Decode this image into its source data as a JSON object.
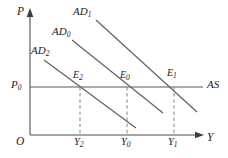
{
  "figure": {
    "kind": "ad-as-diagram",
    "colors": {
      "axis": "#4d4d4d",
      "curve": "#595959",
      "dashed": "#8c8c8c",
      "text": "#1a1a1a",
      "background": "#ffffff"
    },
    "axes": {
      "vertical": {
        "label": "P",
        "label_x": 17,
        "label_y": 7
      },
      "horizontal": {
        "label": "Y",
        "label_x": 207,
        "label_y": 133
      },
      "origin": {
        "label": "O",
        "label_x": 17,
        "label_y": 136
      }
    },
    "curves": [
      {
        "name": "AD1",
        "label": "AD",
        "sub": "1",
        "label_x": 73,
        "label_y": 7,
        "x1": 96,
        "y1": 20,
        "x2": 197,
        "y2": 112
      },
      {
        "name": "AD0",
        "label": "AD",
        "sub": "0",
        "label_x": 52,
        "label_y": 26,
        "x1": 72,
        "y1": 40,
        "x2": 163,
        "y2": 113
      },
      {
        "name": "AD2",
        "label": "AD",
        "sub": "2",
        "label_x": 31,
        "label_y": 45,
        "x1": 44,
        "y1": 60,
        "x2": 136,
        "y2": 128
      },
      {
        "name": "AS",
        "label": "AS",
        "sub": "",
        "label_x": 207,
        "label_y": 79,
        "x1": 30,
        "y1": 87,
        "x2": 203,
        "y2": 87
      }
    ],
    "price_level": {
      "label": "P",
      "sub": "0",
      "label_x": 11,
      "label_y": 79,
      "y": 87
    },
    "equilibria": [
      {
        "name": "E2",
        "label": "E",
        "sub": "2",
        "label_x": 73,
        "label_y": 71,
        "x": 80,
        "y": 87
      },
      {
        "name": "E0",
        "label": "E",
        "sub": "0",
        "label_x": 120,
        "label_y": 71,
        "x": 127,
        "y": 87
      },
      {
        "name": "E1",
        "label": "E",
        "sub": "1",
        "label_x": 167,
        "label_y": 69,
        "x": 174,
        "y": 87
      }
    ],
    "output_ticks": [
      {
        "name": "Y2",
        "label": "Y",
        "sub": "2",
        "label_x": 74,
        "label_y": 137,
        "x": 80
      },
      {
        "name": "Y0",
        "label": "Y",
        "sub": "0",
        "label_x": 121,
        "label_y": 137,
        "x": 127
      },
      {
        "name": "Y1",
        "label": "Y",
        "sub": "1",
        "label_x": 168,
        "label_y": 137,
        "x": 174
      }
    ],
    "dashed_lines": [
      {
        "name": "dashed-Y2",
        "x": 80,
        "y_top": 87,
        "y_bottom": 135
      },
      {
        "name": "dashed-Y0",
        "x": 127,
        "y_top": 87,
        "y_bottom": 135
      },
      {
        "name": "dashed-Y1",
        "x": 174,
        "y_top": 87,
        "y_bottom": 135
      }
    ]
  }
}
